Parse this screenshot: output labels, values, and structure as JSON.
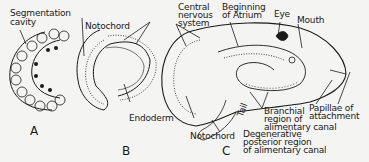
{
  "figure": {
    "panels": [
      {
        "id": "A",
        "label": "A"
      },
      {
        "id": "B",
        "label": "B"
      },
      {
        "id": "C",
        "label": "C"
      }
    ],
    "labels": {
      "segmentation_cavity_1": "Segmentation",
      "segmentation_cavity_2": "cavity",
      "notochord_b": "Notochord",
      "cns_1": "Central",
      "cns_2": "nervous",
      "cns_3": "system",
      "atrium_1": "Beginning",
      "atrium_2": "of Atrium",
      "eye": "Eye",
      "mouth": "Mouth",
      "endoderm": "Endoderm",
      "notochord_c": "Notochord",
      "degenerative_1": "Degenerative",
      "degenerative_2": "posterior region",
      "degenerative_3": "of alimentary canal",
      "tail": "Tail",
      "branchial_1": "Branchial",
      "branchial_2": "region of",
      "branchial_3": "alimentary canal",
      "papillae_1": "Papillae of",
      "papillae_2": "attachment"
    },
    "colors": {
      "ink": "#1a1a1a",
      "paper": "#f4f4f2"
    }
  }
}
